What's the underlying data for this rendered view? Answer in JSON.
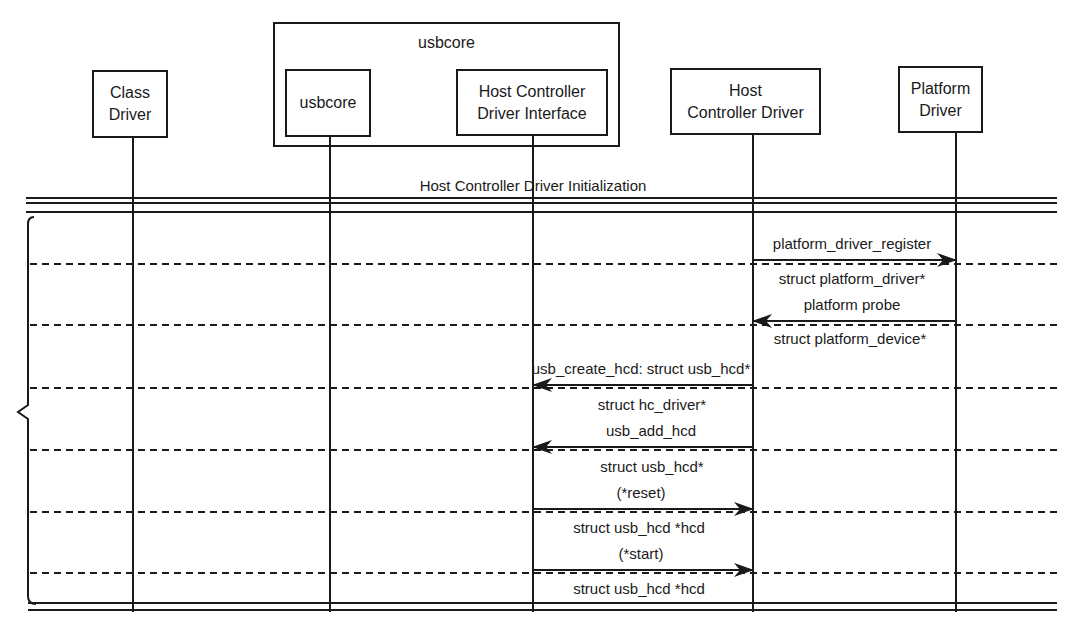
{
  "participants": [
    {
      "id": "class_driver",
      "label_line1": "Class",
      "label_line2": "Driver"
    },
    {
      "id": "usbcore",
      "label_line1": "usbcore",
      "label_line2": ""
    },
    {
      "id": "hcd_interface",
      "label_line1": "Host Controller",
      "label_line2": "Driver Interface"
    },
    {
      "id": "hcd",
      "label_line1": "Host",
      "label_line2": "Controller Driver"
    },
    {
      "id": "platform_driver",
      "label_line1": "Platform",
      "label_line2": "Driver"
    }
  ],
  "group": {
    "label": "usbcore"
  },
  "section": {
    "title": "Host Controller Driver Initialization"
  },
  "messages": [
    {
      "name": "platform_driver_register",
      "above": "platform_driver_register",
      "below": "struct platform_driver*",
      "from": "hcd",
      "to": "platform_driver"
    },
    {
      "name": "platform_probe",
      "above": "platform probe",
      "below": "struct platform_device*",
      "from": "platform_driver",
      "to": "hcd"
    },
    {
      "name": "usb_create_hcd",
      "above": "usb_create_hcd: struct usb_hcd*",
      "below": "struct hc_driver*",
      "from": "hcd",
      "to": "hcd_interface"
    },
    {
      "name": "usb_add_hcd",
      "above": "usb_add_hcd",
      "below": "struct usb_hcd*",
      "from": "hcd",
      "to": "hcd_interface"
    },
    {
      "name": "reset",
      "above": "(*reset)",
      "below": "struct usb_hcd *hcd",
      "from": "hcd_interface",
      "to": "hcd"
    },
    {
      "name": "start",
      "above": "(*start)",
      "below": "struct usb_hcd *hcd",
      "from": "hcd_interface",
      "to": "hcd"
    }
  ]
}
